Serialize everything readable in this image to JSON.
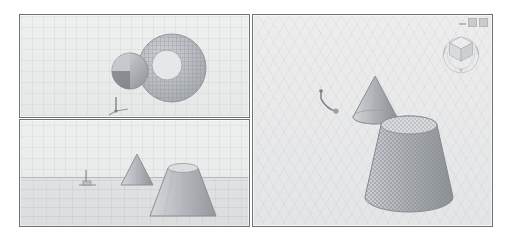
{
  "app": {
    "title": "3D Modeling Viewport",
    "background_color": "#ffffff",
    "panel_border_color": "#6f7276",
    "viewport_background_color": "#e9eaea"
  },
  "window_controls": {
    "minimize_label": "Minimize",
    "maximize_label": "Maximize",
    "close_label": "Close",
    "icons": [
      "minimize-icon",
      "maximize-icon",
      "close-icon"
    ]
  },
  "viewports": [
    {
      "id": "top-view",
      "name": "Top / Plan View",
      "projection": "orthographic",
      "grid": true,
      "objects": [
        {
          "name": "small-cone",
          "shape": "circle",
          "shaded": true,
          "highlighted": false
        },
        {
          "name": "large-cone",
          "shape": "circle",
          "shaded": true,
          "highlighted": true
        }
      ],
      "origin_gizmo": "axis-tripod"
    },
    {
      "id": "front-view",
      "name": "Front / Elevation View",
      "projection": "orthographic",
      "grid": true,
      "ground_plane": true,
      "objects": [
        {
          "name": "small-cone",
          "shape": "cone",
          "shaded": true,
          "highlighted": false
        },
        {
          "name": "large-cone",
          "shape": "cone",
          "shaded": true,
          "highlighted": false
        }
      ],
      "origin_gizmo": "axis-tripod"
    },
    {
      "id": "perspective-view",
      "name": "Perspective View",
      "projection": "perspective",
      "grid": true,
      "active": true,
      "objects": [
        {
          "name": "small-cone",
          "shape": "cone",
          "shaded": true,
          "highlighted": false
        },
        {
          "name": "large-cone",
          "shape": "cone",
          "shaded": true,
          "highlighted": true
        }
      ],
      "origin_gizmo": "axis-tripod",
      "navigation": {
        "widget": "view-cube",
        "faces": [
          "TOP",
          "FRONT",
          "RIGHT"
        ],
        "compass_ring": true
      }
    }
  ],
  "colors": {
    "mesh_fill": "#b9bcc0",
    "mesh_highlight": "#a9adb3",
    "shade_light": "#dfe1e3",
    "shade_dark": "#9ea2a7",
    "grid_line": "#8c9196",
    "axis_marker": "#6e7175"
  }
}
